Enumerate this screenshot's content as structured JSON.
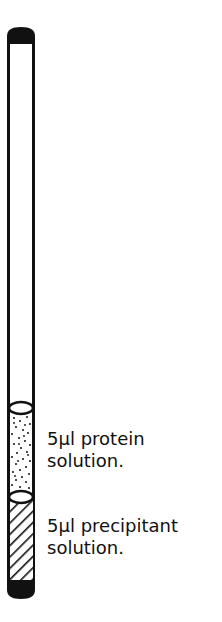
{
  "diagram": {
    "type": "capillary-tube-schematic",
    "colors": {
      "ink": "#111111",
      "background": "#ffffff"
    },
    "components": [
      {
        "name": "top-seal",
        "fill": "solid"
      },
      {
        "name": "empty-capillary",
        "fill": "none"
      },
      {
        "name": "upper-meniscus",
        "shape": "ellipse"
      },
      {
        "name": "protein-solution",
        "fill": "stippled"
      },
      {
        "name": "lower-meniscus",
        "shape": "ellipse"
      },
      {
        "name": "precipitant-solution",
        "fill": "hatched"
      },
      {
        "name": "bottom-seal",
        "fill": "solid"
      }
    ],
    "labels": {
      "protein": {
        "line1": "5µl protein",
        "line2": "solution."
      },
      "precipitant": {
        "line1": "5µl precipitant",
        "line2": "solution."
      }
    }
  }
}
